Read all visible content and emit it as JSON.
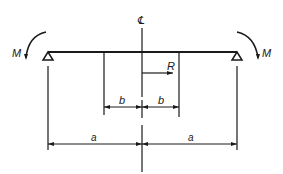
{
  "diagram": {
    "labels": {
      "centerline": "℄",
      "moment_left": "M",
      "moment_right": "M",
      "radius": "R",
      "dim_b_left": "b",
      "dim_b_right": "b",
      "dim_a_left": "a",
      "dim_a_right": "a"
    },
    "colors": {
      "line": "#1a1a1a",
      "background": "#ffffff"
    },
    "elements": {
      "beam": "horizontal beam",
      "supports": [
        "left-pin-support",
        "right-pin-support"
      ],
      "moments": [
        "left-moment-counterclockwise",
        "right-moment-clockwise"
      ],
      "dimensions": [
        "b",
        "b",
        "a",
        "a"
      ]
    }
  }
}
